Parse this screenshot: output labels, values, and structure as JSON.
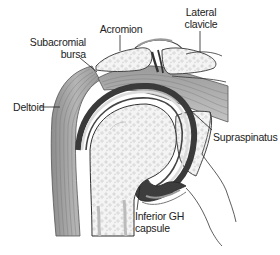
{
  "diagram": {
    "colors": {
      "background": "#ffffff",
      "bone_fill": "#f2f2f2",
      "bone_texture": "#c8c8c8",
      "muscle_fill": "#a9a9a9",
      "muscle_dark": "#7a7a7a",
      "capsule_dark": "#3a3a3a",
      "cartilage": "#d9d9d9",
      "outline": "#333333",
      "label_text": "#222222"
    },
    "labels": {
      "lateral_clavicle": {
        "line1": "Lateral",
        "line2": "clavicle"
      },
      "acromion": {
        "text": "Acromion"
      },
      "subacromial_bursa": {
        "line1": "Subacromial",
        "line2": "bursa"
      },
      "deltoid": {
        "text": "Deltoid"
      },
      "supraspinatus": {
        "text": "Supraspinatus"
      },
      "inferior_gh_capsule": {
        "line1": "Inferior GH",
        "line2": "capsule"
      }
    }
  }
}
